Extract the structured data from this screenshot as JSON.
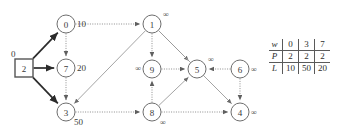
{
  "figure": {
    "kind": "directed-graph-with-state-table",
    "nodes": [
      {
        "id": "2",
        "label": "2",
        "shape": "square",
        "dist": "0",
        "cx": 24,
        "cy": 68,
        "dist_pos": "top-left"
      },
      {
        "id": "0",
        "label": "0",
        "shape": "circle",
        "dist": "10",
        "cx": 66,
        "cy": 24,
        "dist_pos": "right"
      },
      {
        "id": "7",
        "label": "7",
        "shape": "circle",
        "dist": "20",
        "cx": 66,
        "cy": 68,
        "dist_pos": "right"
      },
      {
        "id": "3",
        "label": "3",
        "shape": "circle",
        "dist": "50",
        "cx": 66,
        "cy": 112,
        "dist_pos": "bottom-right"
      },
      {
        "id": "1",
        "label": "1",
        "shape": "circle",
        "dist": "∞",
        "cx": 152,
        "cy": 24,
        "dist_pos": "top-right"
      },
      {
        "id": "9",
        "label": "9",
        "shape": "circle",
        "dist": "∞",
        "cx": 152,
        "cy": 69,
        "dist_pos": "left"
      },
      {
        "id": "5",
        "label": "5",
        "shape": "circle",
        "dist": "∞",
        "cx": 197,
        "cy": 69,
        "dist_pos": "top-right"
      },
      {
        "id": "8",
        "label": "8",
        "shape": "circle",
        "dist": "∞",
        "cx": 152,
        "cy": 112,
        "dist_pos": "bottom-right"
      },
      {
        "id": "6",
        "label": "6",
        "shape": "circle",
        "dist": "∞",
        "cx": 240,
        "cy": 69,
        "dist_pos": "right"
      },
      {
        "id": "4",
        "label": "4",
        "shape": "circle",
        "dist": "∞",
        "cx": 240,
        "cy": 112,
        "dist_pos": "right"
      }
    ],
    "edges": [
      {
        "from": "2",
        "to": "0",
        "style": "bold"
      },
      {
        "from": "2",
        "to": "7",
        "style": "bold"
      },
      {
        "from": "2",
        "to": "3",
        "style": "bold"
      },
      {
        "from": "0",
        "to": "7",
        "style": "dotted"
      },
      {
        "from": "0",
        "to": "1",
        "style": "dotted"
      },
      {
        "from": "7",
        "to": "3",
        "style": "dotted"
      },
      {
        "from": "1",
        "to": "3",
        "style": "gray"
      },
      {
        "from": "1",
        "to": "9",
        "style": "dotted"
      },
      {
        "from": "1",
        "to": "5",
        "style": "gray"
      },
      {
        "from": "1",
        "to": "4",
        "style": "gray"
      },
      {
        "from": "3",
        "to": "8",
        "style": "dotted"
      },
      {
        "from": "9",
        "to": "5",
        "style": "dotted"
      },
      {
        "from": "8",
        "to": "9",
        "style": "dotted"
      },
      {
        "from": "8",
        "to": "5",
        "style": "gray"
      },
      {
        "from": "8",
        "to": "4",
        "style": "dotted"
      },
      {
        "from": "6",
        "to": "5",
        "style": "dotted"
      },
      {
        "from": "6",
        "to": "4",
        "style": "dotted"
      }
    ]
  },
  "table": {
    "rows": [
      {
        "head": "w",
        "cells": [
          "0",
          "3",
          "7"
        ]
      },
      {
        "head": "P",
        "cells": [
          "2",
          "2",
          "2"
        ]
      },
      {
        "head": "L",
        "cells": [
          "10",
          "50",
          "20"
        ]
      }
    ]
  }
}
